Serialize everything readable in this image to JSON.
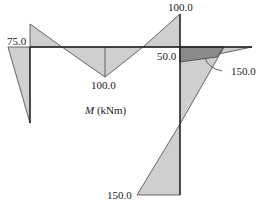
{
  "diagram": {
    "title_symbol": "M",
    "title_units": "(kNm)",
    "labels": {
      "left_top": "75.0",
      "beam_mid": "100.0",
      "top_right": "100.0",
      "joint_right": "50.0",
      "callout": "150.0",
      "column_bottom": "150.0"
    },
    "colors": {
      "fill_light": "#cfcfcf",
      "fill_dark": "#8a8a8a",
      "stroke": "#333333"
    }
  }
}
